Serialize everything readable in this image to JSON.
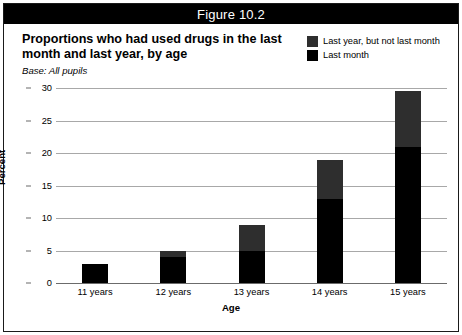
{
  "header": {
    "figure_label": "Figure 10.2"
  },
  "title": {
    "line1": "Proportions who had used drugs in the last",
    "line2": "month and last year, by age",
    "base_note": "Base: All pupils"
  },
  "legend": {
    "position": "top-right",
    "items": [
      {
        "label": "Last year, but not last month",
        "color": "#2e2e2e",
        "swatch_name": "legend-swatch-last-year"
      },
      {
        "label": "Last month",
        "color": "#000000",
        "swatch_name": "legend-swatch-last-month"
      }
    ]
  },
  "chart_data": {
    "type": "bar",
    "stacked": true,
    "title": "Proportions who had used drugs in the last month and last year, by age",
    "subtitle": "Base: All pupils",
    "xlabel": "Age",
    "ylabel": "Percent",
    "categories": [
      "11 years",
      "12 years",
      "13 years",
      "14 years",
      "15 years"
    ],
    "series": [
      {
        "name": "Last month",
        "color": "#000000",
        "values": [
          3,
          4,
          5,
          13,
          21
        ]
      },
      {
        "name": "Last year, but not last month",
        "color": "#2e2e2e",
        "values": [
          0,
          1,
          4,
          6,
          8.5
        ]
      }
    ],
    "totals": [
      3,
      5,
      9,
      19,
      29.5
    ],
    "ylim": [
      0,
      30
    ],
    "yticks": [
      0,
      5,
      10,
      15,
      20,
      25,
      30
    ],
    "ytick_labels": [
      "0",
      "5",
      "10",
      "15",
      "20",
      "25",
      "30"
    ],
    "grid": true,
    "legend_position": "top-right"
  },
  "colors": {
    "header_bar": "#000000",
    "header_text": "#ffffff",
    "grid": "#a8a8a8",
    "axis": "#6b6b6b",
    "border": "#1a1a1a",
    "background": "#ffffff"
  }
}
